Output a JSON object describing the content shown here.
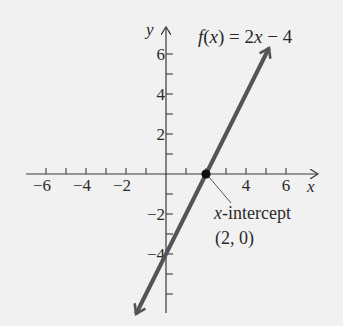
{
  "chart_data": {
    "type": "line",
    "title": "f(x) = 2x − 4",
    "function": {
      "slope": 2,
      "intercept": -4
    },
    "series": [
      {
        "name": "f(x) = 2x − 4",
        "x": [
          -1.5,
          0,
          2,
          5.15
        ],
        "y": [
          -7,
          -4,
          0,
          6.3
        ]
      }
    ],
    "xlabel": "x",
    "ylabel": "y",
    "xlim": [
      -6.5,
      7.6
    ],
    "ylim": [
      -7,
      7.4
    ],
    "x_ticks": [
      -6,
      -5,
      -4,
      -3,
      -2,
      -1,
      1,
      2,
      3,
      4,
      5,
      6
    ],
    "x_tick_labels": [
      "−6",
      "−4",
      "−2",
      "4",
      "6"
    ],
    "x_tick_label_values": [
      -6,
      -4,
      -2,
      4,
      6
    ],
    "y_ticks": [
      -6,
      -5,
      -4,
      -3,
      -2,
      -1,
      1,
      2,
      3,
      4,
      5,
      6
    ],
    "y_tick_labels": [
      "6",
      "4",
      "2",
      "−2",
      "−4"
    ],
    "y_tick_label_values": [
      6,
      4,
      2,
      -2,
      -4
    ],
    "annotations": [
      {
        "text": "x-intercept",
        "point": [
          2,
          0
        ]
      },
      {
        "text": "(2, 0)",
        "point": [
          2,
          0
        ]
      }
    ],
    "grid": false,
    "legend": "none",
    "colors": {
      "line": "#555555",
      "axis": "#3a3a3a",
      "point": "#111111",
      "background": "#f1f1f1"
    }
  },
  "labels": {
    "title": "f(x) = 2x − 4",
    "x_axis": "x",
    "y_axis": "y",
    "intercept_label_var": "x",
    "intercept_label_rest": "-intercept",
    "intercept_coords": "(2, 0)"
  }
}
